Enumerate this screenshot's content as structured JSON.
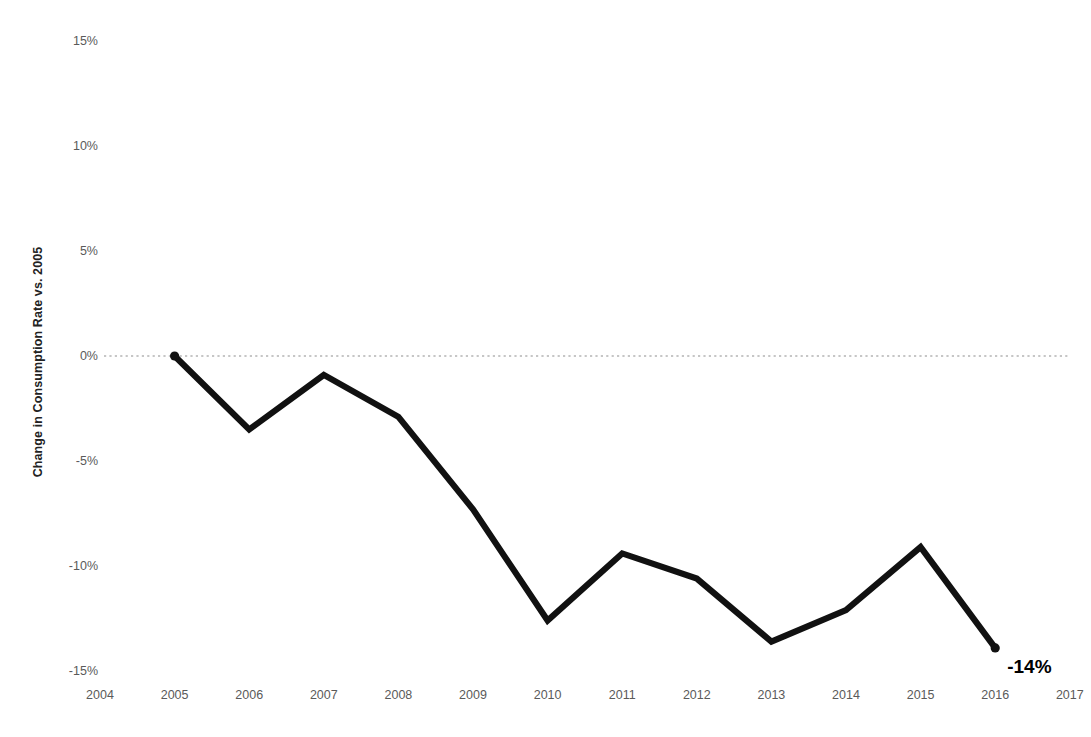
{
  "chart_data": {
    "type": "line",
    "title": "",
    "subtitle": "",
    "xlabel": "",
    "ylabel": "Change in Consumption Rate vs. 2005",
    "x": [
      2005,
      2006,
      2007,
      2008,
      2009,
      2010,
      2011,
      2012,
      2013,
      2014,
      2015,
      2016
    ],
    "values": [
      0,
      -3.5,
      -0.9,
      -2.9,
      -7.3,
      -12.6,
      -9.4,
      -10.6,
      -13.6,
      -12.1,
      -9.1,
      -13.9
    ],
    "series": [
      {
        "name": "Change in Consumption Rate vs. 2005",
        "values": [
          0,
          -3.5,
          -0.9,
          -2.9,
          -7.3,
          -12.6,
          -9.4,
          -10.6,
          -13.6,
          -12.1,
          -9.1,
          -13.9
        ]
      }
    ],
    "xlim": [
      2004,
      2017
    ],
    "ylim": [
      -15,
      15
    ],
    "x_tick_labels": [
      "2004",
      "2005",
      "2006",
      "2007",
      "2008",
      "2009",
      "2010",
      "2011",
      "2012",
      "2013",
      "2014",
      "2015",
      "2016",
      "2017"
    ],
    "y_tick_labels": [
      "15%",
      "10%",
      "5%",
      "0%",
      "-5%",
      "-10%",
      "-15%"
    ],
    "y_tick_values": [
      15,
      10,
      5,
      0,
      -5,
      -10,
      -15
    ],
    "grid": false,
    "zero_line": true,
    "legend": "none",
    "annotations": [
      {
        "text": "-14%",
        "x": 2016,
        "y": -13.9
      }
    ],
    "colors": {
      "line": "#111111",
      "zero_line": "#b4b4b4",
      "tick_label": "#5a5a5a",
      "axis_title": "#222222",
      "background": "#ffffff",
      "annotation": "#000000"
    },
    "marker_points": [
      {
        "x": 2005,
        "y": 0
      },
      {
        "x": 2016,
        "y": -13.9
      }
    ]
  }
}
